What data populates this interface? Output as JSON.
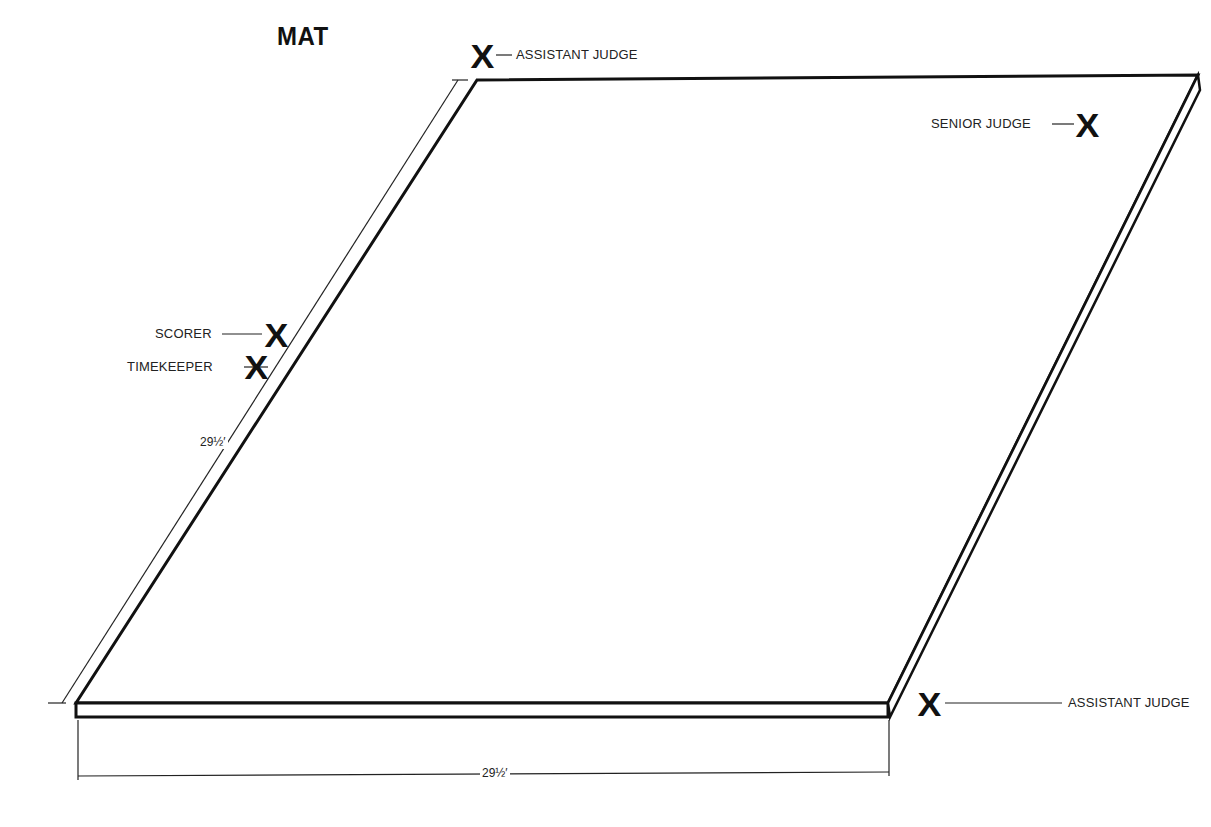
{
  "title": "MAT",
  "mat": {
    "shape": "parallelogram",
    "corners": {
      "top_left": [
        477,
        80
      ],
      "top_right": [
        1198,
        75
      ],
      "bottom_right": [
        888,
        703
      ],
      "bottom_left": [
        76,
        703
      ]
    },
    "thickness_px": 15,
    "line_color": "#111111",
    "fill_color": "#ffffff"
  },
  "positions": [
    {
      "id": "assistant-judge-top",
      "label": "ASSISTANT JUDGE",
      "marker": "X"
    },
    {
      "id": "senior-judge",
      "label": "SENIOR JUDGE",
      "marker": "X"
    },
    {
      "id": "scorer",
      "label": "SCORER",
      "marker": "X"
    },
    {
      "id": "timekeeper",
      "label": "TIMEKEEPER",
      "marker": "X"
    },
    {
      "id": "assistant-judge-bottom",
      "label": "ASSISTANT JUDGE",
      "marker": "X"
    }
  ],
  "dimensions": {
    "side": "29½′",
    "bottom": "29½′"
  }
}
